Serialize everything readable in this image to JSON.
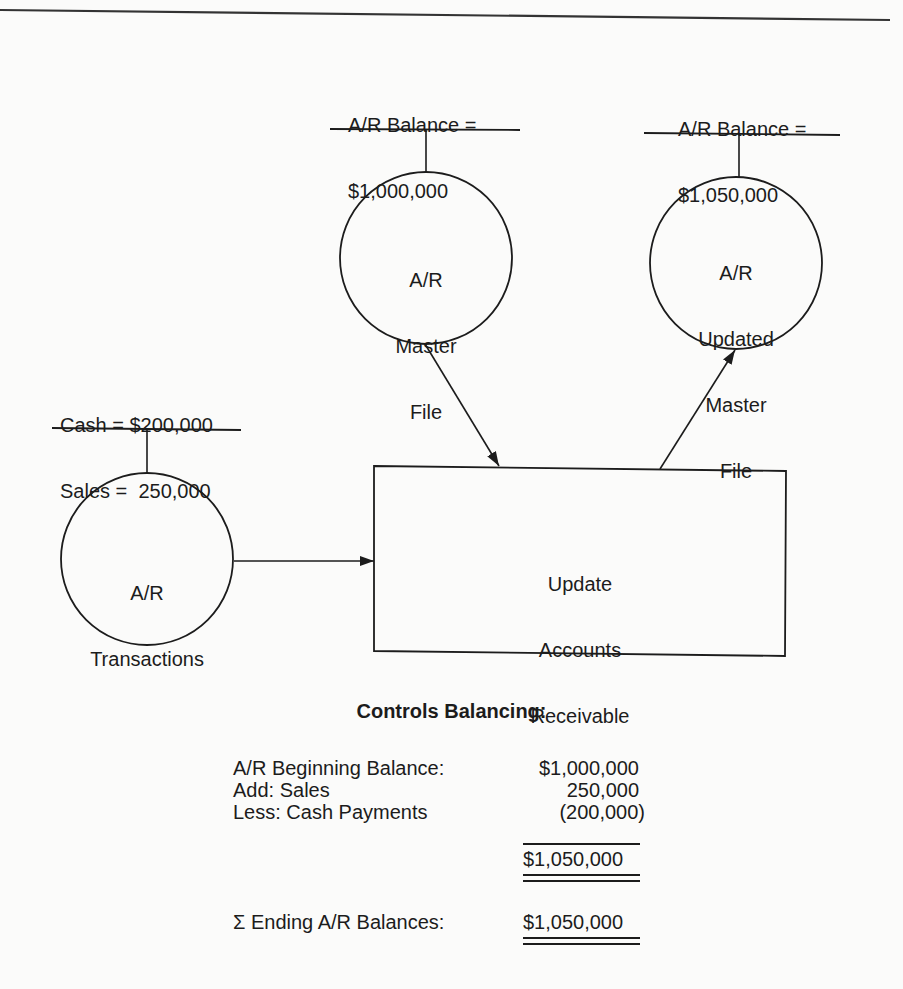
{
  "diagram": {
    "nodes": {
      "master_file": {
        "label": [
          "A/R",
          "Master",
          "File"
        ],
        "shape": "circle"
      },
      "updated_master_file": {
        "label": [
          "A/R",
          "Updated",
          "Master",
          "File"
        ],
        "shape": "circle"
      },
      "transactions": {
        "label": [
          "A/R",
          "Transactions"
        ],
        "shape": "circle"
      },
      "process": {
        "label": [
          "Update",
          "Accounts",
          "Receivable"
        ],
        "shape": "rectangle"
      }
    },
    "annotations": {
      "master_file": {
        "line1": "A/R Balance =",
        "line2": "$1,000,000"
      },
      "updated_master_file": {
        "line1": "A/R Balance =",
        "line2": "$1,050,000"
      },
      "transactions": {
        "line1": "Cash = $200,000",
        "line2": "Sales =  250,000"
      }
    },
    "edges": [
      {
        "from": "master_file",
        "to": "process"
      },
      {
        "from": "transactions",
        "to": "process"
      },
      {
        "from": "process",
        "to": "updated_master_file"
      }
    ]
  },
  "controls": {
    "heading": "Controls Balancing:",
    "rows": [
      {
        "label": "A/R Beginning Balance:",
        "value": "$1,000,000"
      },
      {
        "label": "Add: Sales",
        "value": "250,000"
      },
      {
        "label": "Less: Cash Payments",
        "value": "(200,000)"
      }
    ],
    "subtotal": "$1,050,000",
    "ending_label": "Σ Ending A/R Balances:",
    "ending_value": "$1,050,000"
  }
}
